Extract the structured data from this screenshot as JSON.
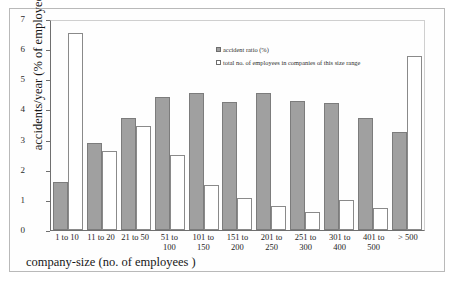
{
  "chart_data": {
    "type": "bar",
    "title": "",
    "xlabel": "company-size (no. of employees )",
    "ylabel": "accidents/year (% of employees)",
    "ylim": [
      0,
      7
    ],
    "yticks": [
      0,
      1,
      2,
      3,
      4,
      5,
      6,
      7
    ],
    "grid": false,
    "legend_position": "top-center",
    "categories": [
      "1 to 10",
      "11 to 20",
      "21 to 50",
      "51 to 100",
      "101 to 150",
      "151 to 200",
      "201 to 250",
      "251 to 300",
      "301 to 400",
      "401 to 500",
      "> 500"
    ],
    "category_lines": [
      [
        "1 to 10"
      ],
      [
        "11 to 20"
      ],
      [
        "21 to 50"
      ],
      [
        "51 to",
        "100"
      ],
      [
        "101 to",
        "150"
      ],
      [
        "151 to",
        "200"
      ],
      [
        "201 to",
        "250"
      ],
      [
        "251 to",
        "300"
      ],
      [
        "301 to",
        "400"
      ],
      [
        "401 to",
        "500"
      ],
      [
        "> 500"
      ]
    ],
    "series": [
      {
        "name": "accident ratio (%)",
        "color": "#a0a0a0",
        "values": [
          1.6,
          2.9,
          3.72,
          4.4,
          4.53,
          4.25,
          4.53,
          4.27,
          4.23,
          3.7,
          3.25
        ]
      },
      {
        "name": "total no. of employees in companies of this size range",
        "color": "#ffffff",
        "values": [
          6.55,
          2.62,
          3.45,
          2.5,
          1.5,
          1.06,
          0.8,
          0.6,
          1.0,
          0.73,
          5.78
        ]
      }
    ]
  },
  "legend": {
    "items": [
      {
        "label": "accident ratio (%)",
        "swatch": "filled-gray"
      },
      {
        "label": "total no. of employees in companies of this size range",
        "swatch": "outline-white"
      }
    ]
  },
  "caption": {
    "text": ""
  }
}
